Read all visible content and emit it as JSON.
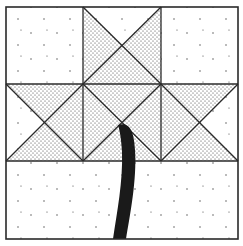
{
  "diagram": {
    "type": "quilt-block",
    "colors": {
      "background": "#ffffff",
      "line": "#2a2a2a",
      "stipple": "#333333",
      "stem": "#1a1a1a"
    },
    "frame": {
      "left": 6,
      "top": 7,
      "right": 238,
      "bottom": 239
    },
    "grid": {
      "cols": [
        6,
        83,
        161,
        238
      ],
      "rows": [
        7,
        84,
        161,
        239
      ]
    },
    "regions": [
      {
        "name": "top-left-square",
        "fill": "light"
      },
      {
        "name": "top-center-cell",
        "fill": "mixed",
        "light_triangle": "top"
      },
      {
        "name": "top-right-square",
        "fill": "light"
      },
      {
        "name": "middle-left-cell",
        "fill": "mixed",
        "light_triangle": "left"
      },
      {
        "name": "middle-center-cell",
        "fill": "dense"
      },
      {
        "name": "middle-right-cell",
        "fill": "mixed",
        "light_triangle": "right"
      },
      {
        "name": "bottom-band",
        "fill": "light"
      },
      {
        "name": "stem",
        "fill": "solid-dark"
      }
    ]
  }
}
